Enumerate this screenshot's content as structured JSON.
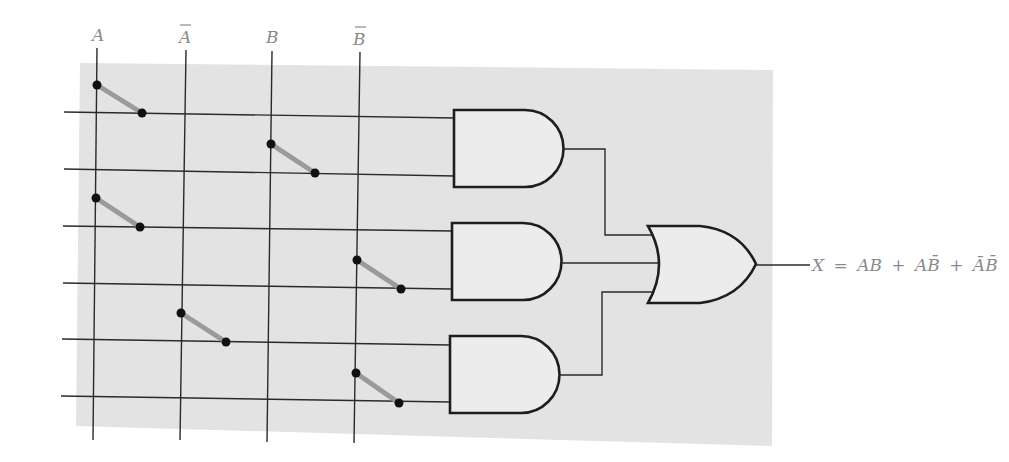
{
  "diagram": {
    "colors": {
      "background_panel": "#e3e3e3",
      "wire": "#2a2a2a",
      "gate_fill": "#ececec",
      "switch_arm": "#9a9a9a",
      "label": "#8a8a8a"
    },
    "input_columns": [
      {
        "id": "A",
        "label": "A",
        "complement": false,
        "x_top": 97,
        "x_bottom": 93
      },
      {
        "id": "A_bar",
        "label": "A",
        "complement": true,
        "x_top": 186,
        "x_bottom": 180
      },
      {
        "id": "B",
        "label": "B",
        "complement": false,
        "x_top": 272,
        "x_bottom": 267
      },
      {
        "id": "B_bar",
        "label": "B",
        "complement": true,
        "x_top": 360,
        "x_bottom": 354
      }
    ],
    "product_lines": [
      {
        "y": 112,
        "gate": 1,
        "connected_to": "A"
      },
      {
        "y": 170,
        "gate": 1,
        "connected_to": "B"
      },
      {
        "y": 226,
        "gate": 2,
        "connected_to": "A"
      },
      {
        "y": 284,
        "gate": 2,
        "connected_to": "B̄"
      },
      {
        "y": 341,
        "gate": 3,
        "connected_to": "Ā"
      },
      {
        "y": 398,
        "gate": 3,
        "connected_to": "B̄"
      }
    ],
    "switches": [
      {
        "column": "A",
        "x1": 97,
        "y1": 85,
        "x2": 142,
        "y2": 113
      },
      {
        "column": "B",
        "x1": 271,
        "y1": 143,
        "x2": 315,
        "y2": 173
      },
      {
        "column": "A",
        "x1": 96,
        "y1": 198,
        "x2": 140,
        "y2": 227
      },
      {
        "column": "B̄",
        "x1": 357,
        "y1": 260,
        "x2": 401,
        "y2": 289
      },
      {
        "column": "Ā",
        "x1": 181,
        "y1": 313,
        "x2": 226,
        "y2": 342
      },
      {
        "column": "B̄",
        "x1": 356,
        "y1": 373,
        "x2": 399,
        "y2": 403
      }
    ],
    "and_gates": [
      {
        "name": "AND gate 1",
        "term": "AB"
      },
      {
        "name": "AND gate 2",
        "term": "AB̄"
      },
      {
        "name": "AND gate 3",
        "term": "ĀB̄"
      }
    ],
    "or_gate": {
      "name": "OR gate"
    },
    "output": {
      "lhs": "X",
      "equals": "=",
      "terms": [
        "AB",
        "AB̄",
        "ĀB̄"
      ],
      "expression": "X = AB + AB̄ + ĀB̄"
    }
  }
}
